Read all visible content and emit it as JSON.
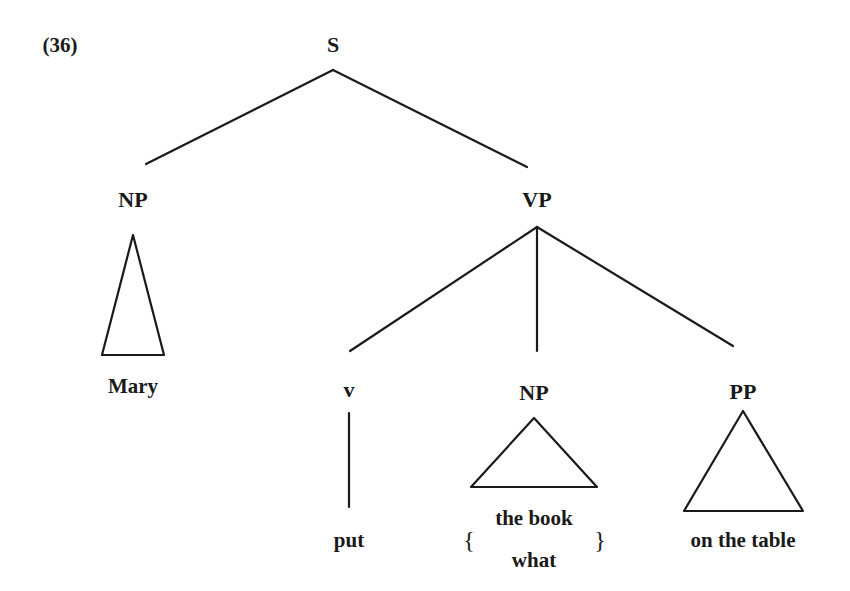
{
  "example_number": "(36)",
  "tree": {
    "root": {
      "label": "S"
    },
    "subject": {
      "label": "NP",
      "terminal": "Mary",
      "roof": true
    },
    "predicate": {
      "label": "VP"
    },
    "verb": {
      "label": "v",
      "terminal": "put"
    },
    "object": {
      "label": "NP",
      "terminal_options": [
        "the book",
        "what"
      ],
      "open_brace": "{",
      "close_brace": "}",
      "roof": true
    },
    "pp": {
      "label": "PP",
      "terminal": "on the table",
      "roof": true
    }
  }
}
